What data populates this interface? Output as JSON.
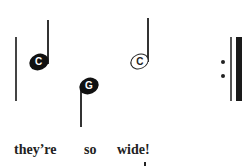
{
  "notation": {
    "notes": [
      {
        "letter": "C",
        "type": "quarter",
        "filled": true,
        "stem": "up"
      },
      {
        "letter": "G",
        "type": "quarter",
        "filled": true,
        "stem": "down"
      },
      {
        "letter": "C",
        "type": "half",
        "filled": false,
        "stem": "up"
      }
    ],
    "barline": "end-repeat",
    "lyrics": [
      "they’re",
      "so",
      "wide!"
    ]
  },
  "colors": {
    "ink": "#222222",
    "background": "#ffffff"
  }
}
